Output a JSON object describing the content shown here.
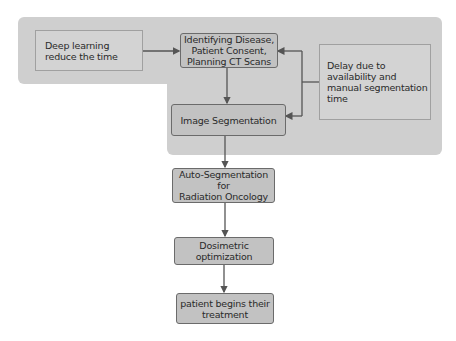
{
  "diagram": {
    "nodes": {
      "deep_learning": "Deep learning\nreduce the time",
      "identifying": "Identifying Disease,\nPatient Consent,\nPlanning CT Scans",
      "delay": "Delay due to\navailability and\nmanual segmentation\ntime",
      "image_segmentation": "Image Segmentation",
      "auto_segmentation": "Auto-Segmentation for\nRadiation Oncology",
      "dosimetric": "Dosimetric\noptimization",
      "patient_treatment": "patient begins their\ntreatment"
    },
    "edges": [
      {
        "from": "deep_learning",
        "to": "identifying"
      },
      {
        "from": "identifying",
        "to": "image_segmentation"
      },
      {
        "from": "delay",
        "to": "identifying"
      },
      {
        "from": "delay",
        "to": "image_segmentation"
      },
      {
        "from": "image_segmentation",
        "to": "auto_segmentation"
      },
      {
        "from": "auto_segmentation",
        "to": "dosimetric"
      },
      {
        "from": "dosimetric",
        "to": "patient_treatment"
      }
    ],
    "colors": {
      "background_region": "#cfcfcf",
      "process_box": "#c2c2c2",
      "note_box": "#d3d3d3",
      "arrow": "#555555"
    }
  }
}
